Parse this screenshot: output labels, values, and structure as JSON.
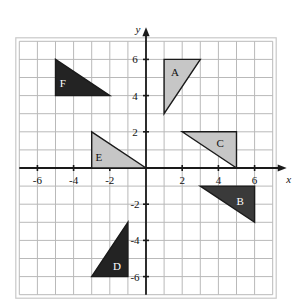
{
  "figure": {
    "kind": "coordinate-plane-with-triangles",
    "background": "#ffffff",
    "grid_color": "#b9b9b9",
    "axis_color": "#1a1a1a",
    "outline_color": "#c9c9c9"
  },
  "axes": {
    "x_label": "x",
    "y_label": "y",
    "x_min": -7,
    "x_max": 7,
    "y_min": -7,
    "y_max": 7,
    "x_ticks": [
      -6,
      -4,
      -2,
      2,
      4,
      6
    ],
    "y_ticks": [
      6,
      4,
      2,
      -2,
      -4,
      -6
    ],
    "x_tick_labels": [
      "-6",
      "-4",
      "-2",
      "2",
      "4",
      "6"
    ],
    "y_tick_labels": [
      "6",
      "4",
      "2",
      "-2",
      "-4",
      "-6"
    ],
    "grid_step": 1,
    "grid": true
  },
  "chart_data": {
    "type": "scatter",
    "title": "",
    "xlabel": "x",
    "ylabel": "y",
    "xlim": [
      -7,
      7
    ],
    "ylim": [
      -7,
      7
    ],
    "grid": true,
    "shapes": [
      {
        "label": "A",
        "fill": "#c6c6c6",
        "stroke": "#1a1a1a",
        "vertices": [
          [
            1,
            6
          ],
          [
            3,
            6
          ],
          [
            1,
            3
          ]
        ],
        "label_at": [
          1.6,
          5.3
        ]
      },
      {
        "label": "B",
        "fill": "#3a3a3a",
        "stroke": "#1a1a1a",
        "text_color": "#ffffff",
        "vertices": [
          [
            3,
            -1
          ],
          [
            6,
            -1
          ],
          [
            6,
            -3
          ]
        ],
        "label_at": [
          5.2,
          -1.8
        ]
      },
      {
        "label": "C",
        "fill": "#c6c6c6",
        "stroke": "#1a1a1a",
        "vertices": [
          [
            2,
            2
          ],
          [
            5,
            2
          ],
          [
            5,
            0
          ]
        ],
        "label_at": [
          4.1,
          1.4
        ]
      },
      {
        "label": "D",
        "fill": "#232323",
        "stroke": "#1a1a1a",
        "text_color": "#ffffff",
        "vertices": [
          [
            -1,
            -3
          ],
          [
            -1,
            -6
          ],
          [
            -3,
            -6
          ]
        ],
        "label_at": [
          -1.6,
          -5.4
        ]
      },
      {
        "label": "E",
        "fill": "#c6c6c6",
        "stroke": "#1a1a1a",
        "vertices": [
          [
            -3,
            2
          ],
          [
            -3,
            0
          ],
          [
            0,
            0
          ]
        ],
        "label_at": [
          -2.6,
          0.6
        ]
      },
      {
        "label": "F",
        "fill": "#232323",
        "stroke": "#1a1a1a",
        "text_color": "#ffffff",
        "vertices": [
          [
            -5,
            6
          ],
          [
            -5,
            4
          ],
          [
            -2,
            4
          ]
        ],
        "label_at": [
          -4.6,
          4.7
        ]
      }
    ]
  }
}
